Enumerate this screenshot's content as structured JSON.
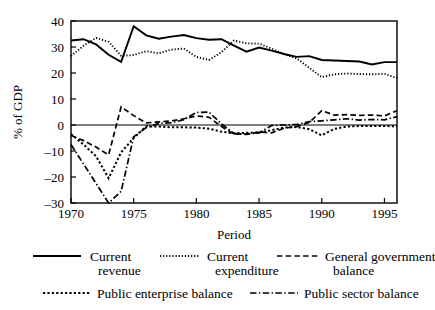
{
  "chart_data": {
    "type": "line",
    "title": "",
    "xlabel": "Period",
    "ylabel": "% of GDP",
    "xlim": [
      1970,
      1996
    ],
    "ylim": [
      -30,
      40
    ],
    "xticks": [
      1970,
      1975,
      1980,
      1985,
      1990,
      1995
    ],
    "xticklabels": [
      "1970",
      "1975",
      "1980",
      "1985",
      "1990",
      "1995"
    ],
    "yticks": [
      -30,
      -20,
      -10,
      0,
      10,
      20,
      30,
      40
    ],
    "yticklabels": [
      "–30",
      "–20",
      "–10",
      "0",
      "10",
      "20",
      "30",
      "40"
    ],
    "grid": false,
    "legend_position": "below",
    "zero_reference_line": true,
    "x": [
      1970,
      1971,
      1972,
      1973,
      1974,
      1975,
      1976,
      1977,
      1978,
      1979,
      1980,
      1981,
      1982,
      1983,
      1984,
      1985,
      1986,
      1987,
      1988,
      1989,
      1990,
      1991,
      1992,
      1993,
      1994,
      1995,
      1996
    ],
    "series": [
      {
        "name": "Current revenue",
        "style": "solid",
        "values": [
          32.5,
          33.0,
          31.0,
          27.0,
          24.3,
          38.0,
          34.5,
          33.2,
          34.0,
          34.6,
          33.4,
          32.8,
          33.0,
          30.5,
          28.2,
          29.8,
          28.6,
          27.3,
          26.2,
          26.5,
          25.0,
          24.8,
          24.6,
          24.4,
          23.3,
          24.2,
          24.2
        ]
      },
      {
        "name": "Current expenditure",
        "style": "dotted-fine",
        "values": [
          26.5,
          30.5,
          33.5,
          32.0,
          26.6,
          26.9,
          28.4,
          27.6,
          29.0,
          29.4,
          26.2,
          25.0,
          28.0,
          32.5,
          31.4,
          31.3,
          29.4,
          27.2,
          25.6,
          22.0,
          18.4,
          19.5,
          19.8,
          19.6,
          19.5,
          19.7,
          18.0
        ]
      },
      {
        "name": "General government balance",
        "style": "dashed",
        "values": [
          -4.0,
          -6.0,
          -8.5,
          -11.5,
          7.0,
          3.6,
          0.8,
          1.2,
          1.6,
          2.4,
          3.5,
          3.0,
          -0.6,
          -3.5,
          -3.6,
          -2.7,
          -3.0,
          -1.2,
          -0.6,
          1.0,
          5.5,
          3.8,
          4.0,
          3.7,
          3.8,
          3.5,
          5.5
        ]
      },
      {
        "name": "Public enterprise balance",
        "style": "dotted-coarse",
        "values": [
          -3.5,
          -7.5,
          -12.0,
          -20.5,
          -10.5,
          -5.0,
          -0.5,
          -0.6,
          -0.9,
          -0.9,
          -1.0,
          -1.4,
          -2.6,
          -3.2,
          -3.0,
          -2.9,
          -2.0,
          -1.0,
          -0.8,
          -1.6,
          -4.0,
          -1.5,
          -0.6,
          -0.4,
          -0.4,
          -0.4,
          -0.5
        ]
      },
      {
        "name": "Public sector balance",
        "style": "dash-dot",
        "values": [
          -7.5,
          -15.0,
          -22.5,
          -30.0,
          -25.5,
          -4.5,
          -1.0,
          0.6,
          0.9,
          2.0,
          4.8,
          5.0,
          0.4,
          -3.3,
          -3.5,
          -3.0,
          -0.2,
          0.0,
          0.2,
          1.3,
          1.6,
          2.0,
          2.4,
          1.9,
          2.1,
          2.0,
          3.2
        ]
      }
    ]
  },
  "legend": {
    "entries": [
      {
        "label_line1": "Current",
        "label_line2": "revenue",
        "style": "solid"
      },
      {
        "label_line1": "Current",
        "label_line2": "expenditure",
        "style": "dotted-fine"
      },
      {
        "label_line1": "General government",
        "label_line2": "balance",
        "style": "dashed"
      },
      {
        "label_line1": "Public enterprise balance",
        "label_line2": "",
        "style": "dotted-coarse"
      },
      {
        "label_line1": "Public sector balance",
        "label_line2": "",
        "style": "dash-dot"
      }
    ]
  },
  "colors": {
    "ink": "#000000",
    "background": "#ffffff"
  }
}
